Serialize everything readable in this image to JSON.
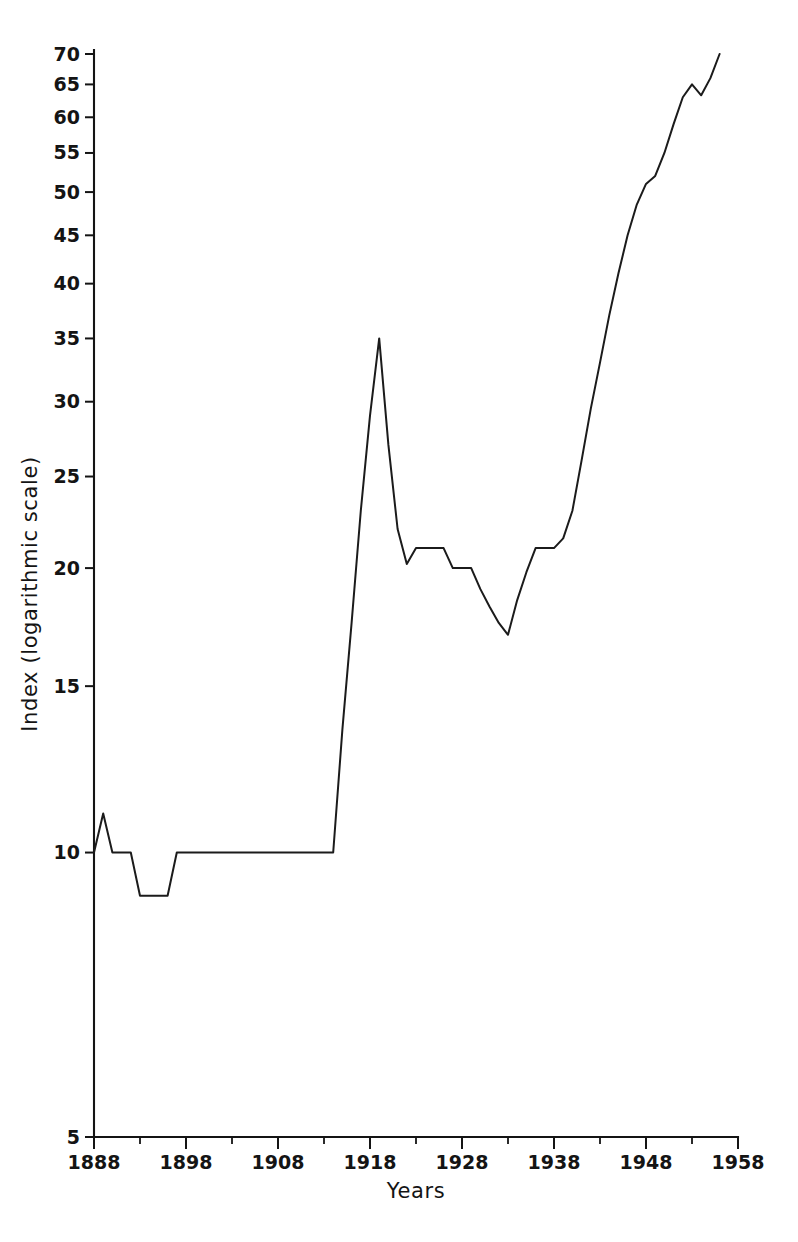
{
  "chart_data": {
    "type": "line",
    "title": "",
    "xlabel": "Years",
    "ylabel": "Index (logarithmic scale)",
    "yscale": "log",
    "ylim": [
      5,
      70
    ],
    "xlim": [
      1888,
      1958
    ],
    "grid": false,
    "legend": false,
    "y_ticks": [
      5,
      10,
      15,
      20,
      25,
      30,
      35,
      40,
      45,
      50,
      55,
      60,
      65,
      70
    ],
    "y_tick_labels": [
      "5",
      "10",
      "15",
      "20",
      "25",
      "30",
      "35",
      "40",
      "45",
      "50",
      "55",
      "60",
      "65",
      "70"
    ],
    "x_ticks": [
      1888,
      1898,
      1908,
      1918,
      1928,
      1938,
      1948,
      1958
    ],
    "x_tick_labels": [
      "1888",
      "1898",
      "1908",
      "1918",
      "1928",
      "1938",
      "1948",
      "1958"
    ],
    "x_minor_ticks": [
      1893,
      1903,
      1913,
      1923,
      1933,
      1943,
      1953
    ],
    "line_color": "#1b1b1b",
    "series": [
      {
        "name": "Index",
        "x": [
          1888,
          1889,
          1890,
          1891,
          1892,
          1893,
          1894,
          1895,
          1896,
          1897,
          1898,
          1899,
          1900,
          1901,
          1902,
          1903,
          1904,
          1905,
          1906,
          1907,
          1908,
          1909,
          1910,
          1911,
          1912,
          1913,
          1914,
          1915,
          1916,
          1917,
          1918,
          1919,
          1920,
          1921,
          1922,
          1923,
          1924,
          1925,
          1926,
          1927,
          1928,
          1929,
          1930,
          1931,
          1932,
          1933,
          1934,
          1935,
          1936,
          1937,
          1938,
          1939,
          1940,
          1941,
          1942,
          1943,
          1944,
          1945,
          1946,
          1947,
          1948,
          1949,
          1950,
          1951,
          1952,
          1953,
          1954,
          1955,
          1956
        ],
        "values": [
          10,
          11,
          10,
          10,
          10,
          9,
          9,
          9,
          9,
          10,
          10,
          10,
          10,
          10,
          10,
          10,
          10,
          10,
          10,
          10,
          10,
          10,
          10,
          10,
          10,
          10,
          10,
          13.5,
          17.5,
          23,
          29,
          35,
          27,
          22,
          20.2,
          21,
          21,
          21,
          21,
          20,
          20,
          20,
          19,
          18.2,
          17.5,
          17,
          18.5,
          19.8,
          21,
          21,
          21,
          21.5,
          23,
          26,
          29.5,
          33,
          37,
          41,
          45,
          48.5,
          51,
          52,
          55,
          59,
          63,
          65,
          63.3,
          66,
          70
        ]
      }
    ]
  },
  "axes": {
    "y_title": "Index (logarithmic scale)",
    "x_title": "Years"
  }
}
